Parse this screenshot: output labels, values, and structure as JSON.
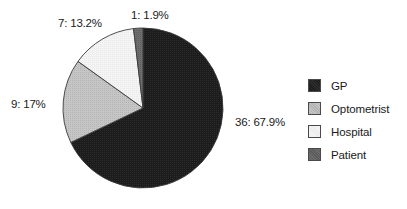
{
  "chart_data": {
    "type": "pie",
    "title": "",
    "subtitle": "",
    "xlabel": "",
    "ylabel": "",
    "grid": false,
    "legend_position": "right",
    "start_angle_deg": 0,
    "direction": "clockwise",
    "categories": [
      "GP",
      "Optometrist",
      "Hospital",
      "Patient"
    ],
    "values": [
      36,
      9,
      7,
      1
    ],
    "percentages": [
      67.9,
      17.0,
      13.2,
      1.9
    ],
    "total": 53,
    "colors": [
      "#1c1c1c",
      "#c0c0c0",
      "#f2f2f2",
      "#6e6e6e"
    ],
    "data_labels": [
      "36: 67.9%",
      "9: 17%",
      "7: 13.2%",
      "1: 1.9%"
    ],
    "slices": [
      {
        "name": "GP",
        "value": 36,
        "percent": 67.9,
        "label": "36: 67.9%",
        "color": "#1c1c1c"
      },
      {
        "name": "Optometrist",
        "value": 9,
        "percent": 17.0,
        "label": "9: 17%",
        "color": "#c0c0c0"
      },
      {
        "name": "Hospital",
        "value": 7,
        "percent": 13.2,
        "label": "7: 13.2%",
        "color": "#f2f2f2"
      },
      {
        "name": "Patient",
        "value": 1,
        "percent": 1.9,
        "label": "1: 1.9%",
        "color": "#6e6e6e"
      }
    ]
  },
  "labels": {
    "gp": "36: 67.9%",
    "optometrist": "9: 17%",
    "hospital": "7: 13.2%",
    "patient": "1: 1.9%"
  },
  "legend": {
    "items": [
      {
        "label": "GP",
        "color": "#1c1c1c"
      },
      {
        "label": "Optometrist",
        "color": "#c0c0c0"
      },
      {
        "label": "Hospital",
        "color": "#f2f2f2"
      },
      {
        "label": "Patient",
        "color": "#6e6e6e"
      }
    ]
  }
}
